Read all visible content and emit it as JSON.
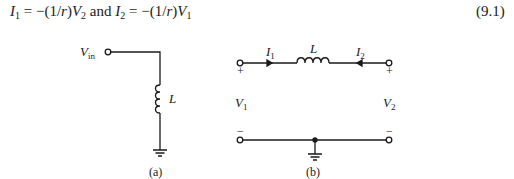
{
  "equation": {
    "lhs1": "I",
    "lhs1_sub": "1",
    "rhs1": " = −(1/",
    "r1": "r",
    "rhs1b": ")",
    "v1": "V",
    "v1_sub": "2",
    "and": " and ",
    "lhs2": "I",
    "lhs2_sub": "2",
    "rhs2": " = −(1/",
    "r2": "r",
    "rhs2b": ")",
    "v2": "V",
    "v2_sub": "1",
    "number": "(9.1)"
  },
  "figure_a": {
    "input_label": "V",
    "input_sub": "in",
    "inductor_label": "L",
    "caption": "(a)"
  },
  "figure_b": {
    "current1": "I",
    "current1_sub": "1",
    "current2": "I",
    "current2_sub": "2",
    "inductor_label": "L",
    "port1_voltage": "V",
    "port1_sub": "1",
    "port2_voltage": "V",
    "port2_sub": "2",
    "plus": "+",
    "minus": "−",
    "caption": "(b)"
  }
}
